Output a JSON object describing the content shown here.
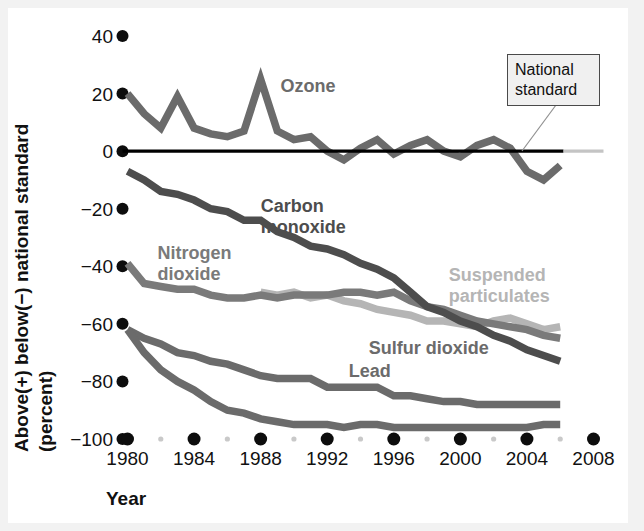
{
  "chart_data": {
    "type": "line",
    "title": "",
    "xlabel": "Year",
    "ylabel": "Above(+) below(−) national standard (percent)",
    "ylabel_line1": "Above(+) below(−) national standard",
    "ylabel_line2": "(percent)",
    "xlim": [
      1980,
      2008
    ],
    "ylim": [
      -100,
      40
    ],
    "yticks": [
      40,
      20,
      0,
      -20,
      -40,
      -60,
      -80,
      -100
    ],
    "ytick_labels": [
      "40",
      "20",
      "0",
      "−20",
      "−40",
      "−60",
      "−80",
      "−100"
    ],
    "xticks": [
      1980,
      1984,
      1988,
      1992,
      1996,
      2000,
      2004,
      2008
    ],
    "xtick_labels": [
      "1980",
      "1984",
      "1988",
      "1992",
      "1996",
      "2000",
      "2004",
      "2008"
    ],
    "minor_xticks": [
      1982,
      1986,
      1990,
      1994,
      1998,
      2002,
      2006
    ],
    "grid": false,
    "legend": "inline-labels",
    "reference_line": {
      "label": "National standard",
      "value": 0,
      "color": "#000000",
      "x_start": 1980,
      "x_end": 2006.2
    },
    "annotations": [
      {
        "name": "national-standard-callout",
        "text": "National standard",
        "points_to_year": 2003.4,
        "points_to_value": 0
      }
    ],
    "x": [
      1980,
      1981,
      1982,
      1983,
      1984,
      1985,
      1986,
      1987,
      1988,
      1989,
      1990,
      1991,
      1992,
      1993,
      1994,
      1995,
      1996,
      1997,
      1998,
      1999,
      2000,
      2001,
      2002,
      2003,
      2004,
      2005,
      2006
    ],
    "series": [
      {
        "name": "Ozone",
        "color": "#6b6b6b",
        "label_year": 1989.2,
        "label_value": 20.5,
        "values": [
          20,
          13,
          8,
          19,
          8,
          6,
          5,
          7,
          25,
          7,
          4,
          5,
          0,
          -3,
          1,
          4,
          -1,
          2,
          4,
          0,
          -2,
          2,
          4,
          1,
          -7,
          -10,
          -5
        ]
      },
      {
        "name": "Carbon monoxide",
        "color": "#4d4d4d",
        "label_year": 1988.0,
        "label_value": -21.0,
        "label_line2": "monoxide",
        "values": [
          -7,
          -10,
          -14,
          -15,
          -17,
          -20,
          -21,
          -24,
          -24,
          -28,
          -30,
          -33,
          -34,
          -36,
          -39,
          -41,
          -44,
          -49,
          -54,
          -56,
          -59,
          -61,
          -64,
          -66,
          -69,
          -71,
          -73
        ]
      },
      {
        "name": "Nitrogen dioxide",
        "color": "#7a7a7a",
        "label_year": 1981.8,
        "label_value": -37.5,
        "label_line2": "dioxide",
        "values": [
          -39,
          -46,
          -47,
          -48,
          -48,
          -50,
          -51,
          -51,
          -50,
          -51,
          -50,
          -50,
          -50,
          -49,
          -49,
          -50,
          -49,
          -52,
          -54,
          -55,
          -57,
          -59,
          -60,
          -61,
          -62,
          -64,
          -65
        ]
      },
      {
        "name": "Suspended particulates",
        "color": "#b5b5b5",
        "label_year": 1999.3,
        "label_value": -45.0,
        "label_line2": "particulates",
        "start_year": 1988,
        "values": [
          null,
          null,
          null,
          null,
          null,
          null,
          null,
          null,
          -49,
          -50,
          -49,
          -51,
          -50,
          -52,
          -53,
          -55,
          -56,
          -57,
          -59,
          -59,
          -60,
          -61,
          -59,
          -58,
          -60,
          -62,
          -61
        ]
      },
      {
        "name": "Sulfur dioxide",
        "color": "#6b6b6b",
        "label_year": 1994.5,
        "label_value": -70.5,
        "values": [
          -62,
          -65,
          -67,
          -70,
          -71,
          -73,
          -74,
          -76,
          -78,
          -79,
          -79,
          -79,
          -82,
          -82,
          -82,
          -82,
          -85,
          -85,
          -86,
          -87,
          -87,
          -88,
          -88,
          -88,
          -88,
          -88,
          -88
        ]
      },
      {
        "name": "Lead",
        "color": "#6b6b6b",
        "label_year": 1993.3,
        "label_value": -78.5,
        "values": [
          -62,
          -70,
          -76,
          -80,
          -83,
          -87,
          -90,
          -91,
          -93,
          -94,
          -95,
          -95,
          -95,
          -96,
          -95,
          -95,
          -96,
          -96,
          -96,
          -96,
          -96,
          -96,
          -96,
          -96,
          -96,
          -95,
          -95
        ]
      }
    ]
  },
  "colors": {
    "background": "#f2f2f2",
    "plate": "#ffffff",
    "tick_dot": "#0d0d0d",
    "minor_tick_dot": "#c9c9c9",
    "reference_line": "#000000",
    "callout_box_bg": "#f0f0f0",
    "callout_box_border": "#555555",
    "callout_leader": "#808080"
  }
}
